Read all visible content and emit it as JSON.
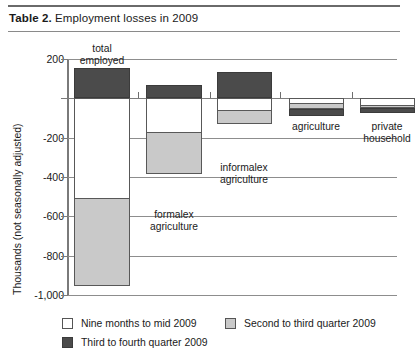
{
  "figure": {
    "label_prefix": "Table 2.",
    "title": "Employment losses in 2009"
  },
  "chart_data": {
    "type": "bar",
    "subtype": "stacked-bar-diverging",
    "title": "Employment losses in 2009",
    "xlabel": "",
    "ylabel": "Thousands (not seasonally adjusted)",
    "ylim": [
      -1000,
      200
    ],
    "yticks": [
      200,
      0,
      -200,
      -400,
      -600,
      -800,
      -1000
    ],
    "ytick_labels": [
      "200",
      "",
      "-200",
      "-400",
      "-600",
      "-800",
      "-1,000"
    ],
    "grid": true,
    "legend_position": "bottom",
    "categories": [
      "total employed",
      "formal ex agriculture",
      "informal ex agriculture",
      "agriculture",
      "private household"
    ],
    "series": [
      {
        "name": "Nine months to mid 2009",
        "color": "#ffffff",
        "values": [
          -515,
          -175,
          -65,
          -30,
          -40
        ]
      },
      {
        "name": "Second to third quarter 2009",
        "color": "#c9c9c9",
        "values": [
          -445,
          -215,
          -70,
          -30,
          -15
        ]
      },
      {
        "name": "Third to fourth quarter 2009",
        "color": "#4b4b4b",
        "values": [
          155,
          70,
          135,
          -35,
          -25
        ]
      }
    ],
    "totals": [
      -805,
      -320,
      0,
      -95,
      -80
    ]
  },
  "yaxis": {
    "ticks": [
      {
        "value": 200,
        "label": "200"
      },
      {
        "value": 0,
        "label": ""
      },
      {
        "value": -200,
        "label": "-200"
      },
      {
        "value": -400,
        "label": "-400"
      },
      {
        "value": -600,
        "label": "-600"
      },
      {
        "value": -800,
        "label": "-800"
      },
      {
        "value": -1000,
        "label": "-1,000"
      }
    ],
    "title": "Thousands (not seasonally adjusted)"
  },
  "categories": [
    {
      "id": "total-employed",
      "label": "total\nemployed"
    },
    {
      "id": "formal-ex-agriculture",
      "label": "formalex\nagriculture"
    },
    {
      "id": "informal-ex-agriculture",
      "label": "informalex\nagriculture"
    },
    {
      "id": "agriculture",
      "label": "agriculture"
    },
    {
      "id": "private-household",
      "label": "private\nhousehold"
    }
  ],
  "legend": {
    "items": [
      {
        "id": "nine-months-to-mid-2009",
        "label": "Nine months to mid 2009",
        "swatch": "white"
      },
      {
        "id": "second-to-third-quarter-2009",
        "label": "Second to third quarter 2009",
        "swatch": "gray"
      },
      {
        "id": "third-to-fourth-quarter-2009",
        "label": "Third to fourth quarter 2009",
        "swatch": "dark"
      }
    ]
  },
  "colors": {
    "white_segment": "#ffffff",
    "gray_segment": "#c9c9c9",
    "dark_segment": "#4b4b4b",
    "axis": "#7a7a7a",
    "grid": "#8d8d8d",
    "text": "#1a1a1a"
  }
}
